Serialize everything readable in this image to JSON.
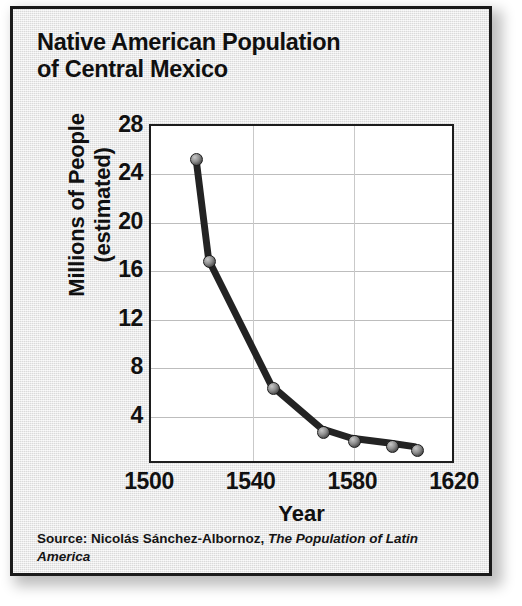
{
  "card": {
    "title_lines": [
      "Native American Population",
      "of Central Mexico"
    ],
    "source_prefix": "Source: Nicolás Sánchez-Albornoz, ",
    "source_book": "The Population of Latin America"
  },
  "chart_data": {
    "type": "line",
    "title": "Native American Population of Central Mexico",
    "xlabel": "Year",
    "ylabel_lines": [
      "Millions of People",
      "(estimated)"
    ],
    "ylabel": "Millions of People (estimated)",
    "xlim": [
      1500,
      1620
    ],
    "ylim": [
      0,
      28
    ],
    "xticks": [
      1500,
      1540,
      1580,
      1620
    ],
    "yticks": [
      4,
      8,
      12,
      16,
      20,
      24,
      28
    ],
    "grid": true,
    "legend": "none",
    "marker": "circle-3d-gray",
    "line_color": "#232323",
    "x": [
      1518,
      1523,
      1548,
      1568,
      1580,
      1595,
      1605
    ],
    "values": [
      25.2,
      16.8,
      6.3,
      2.7,
      1.9,
      1.5,
      1.2
    ],
    "points": [
      {
        "year": 1518,
        "millions": 25.2
      },
      {
        "year": 1523,
        "millions": 16.8
      },
      {
        "year": 1548,
        "millions": 6.3
      },
      {
        "year": 1568,
        "millions": 2.7
      },
      {
        "year": 1580,
        "millions": 1.9
      },
      {
        "year": 1595,
        "millions": 1.5
      },
      {
        "year": 1605,
        "millions": 1.2
      }
    ]
  }
}
